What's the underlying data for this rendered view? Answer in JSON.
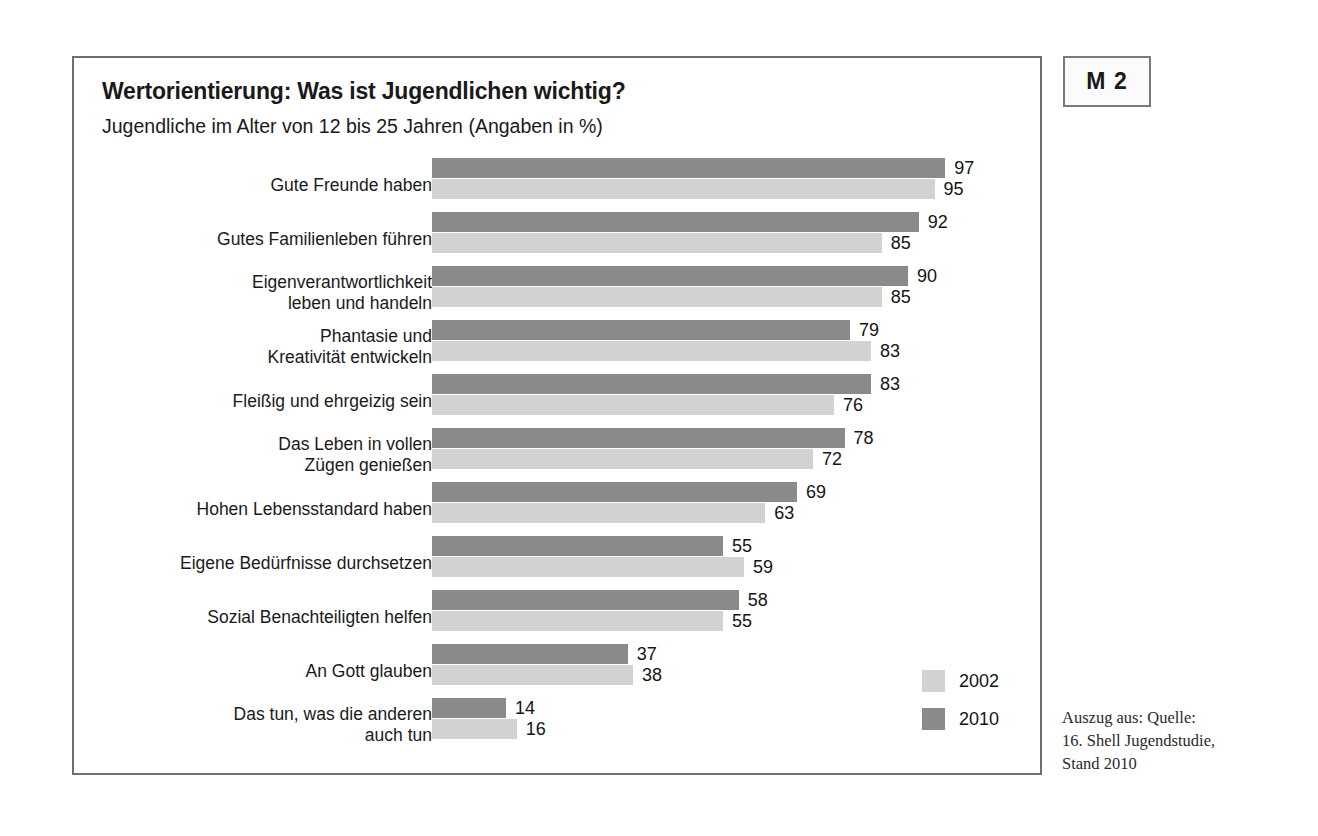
{
  "badge": {
    "label": "M 2"
  },
  "header": {
    "title": "Wertorientierung: Was ist Jugendlichen wichtig?",
    "subtitle": "Jugendliche im Alter von 12 bis 25 Jahren (Angaben in %)"
  },
  "legend": {
    "items": [
      {
        "label": "2002",
        "color": "#d2d2d2"
      },
      {
        "label": "2010",
        "color": "#8a8a8a"
      }
    ]
  },
  "source_note": "Auszug aus: Quelle:\n16. Shell Jugendstudie,\nStand 2010",
  "chart_data": {
    "type": "bar",
    "orientation": "horizontal",
    "title": "Wertorientierung: Was ist Jugendlichen wichtig?",
    "subtitle": "Jugendliche im Alter von 12 bis 25 Jahren (Angaben in %)",
    "xlabel": "",
    "ylabel": "",
    "xlim": [
      0,
      100
    ],
    "grid": false,
    "legend_position": "bottom-right",
    "value_suffix": "%",
    "categories": [
      "Gute Freunde haben",
      "Gutes Familienleben führen",
      "Eigenverantwortlichkeit\nleben und handeln",
      "Phantasie und\nKreativität entwickeln",
      "Fleißig und ehrgeizig sein",
      "Das Leben in vollen\nZügen genießen",
      "Hohen Lebensstandard haben",
      "Eigene Bedürfnisse durchsetzen",
      "Sozial Benachteiligten helfen",
      "An Gott glauben",
      "Das tun, was die anderen\nauch tun"
    ],
    "series": [
      {
        "name": "2010",
        "color": "#8a8a8a",
        "values": [
          97,
          92,
          90,
          79,
          83,
          78,
          69,
          55,
          58,
          37,
          14
        ]
      },
      {
        "name": "2002",
        "color": "#d2d2d2",
        "values": [
          95,
          85,
          85,
          83,
          76,
          72,
          63,
          59,
          55,
          38,
          16
        ]
      }
    ]
  }
}
